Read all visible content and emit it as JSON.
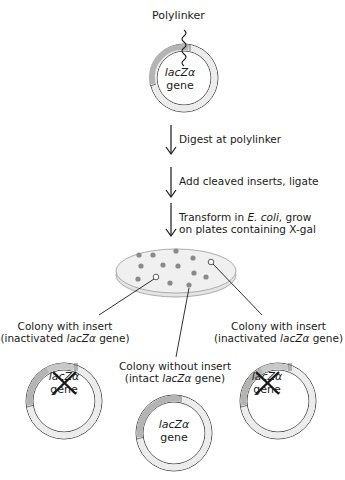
{
  "figure": {
    "top_plasmid": {
      "polylinker_label": "Polylinker",
      "gene_italic": "lacZα",
      "gene_word": "gene"
    },
    "steps": [
      {
        "line1": "Digest at polylinker"
      },
      {
        "line1": "Add cleaved inserts, ligate"
      },
      {
        "line1_prefix": "Transform in ",
        "line1_italic": "E. coli",
        "line1_suffix": ", grow",
        "line2": "on plates containing X-gal"
      }
    ],
    "plate": {
      "blue_colonies": 12,
      "white_colonies": 2
    },
    "outcomes": {
      "left": {
        "line1": "Colony with insert",
        "line2_prefix": "(inactivated ",
        "line2_italic": "lacZα",
        "line2_suffix": " gene)",
        "gene_italic": "lacZα",
        "gene_word": "gene",
        "crossed_out": true
      },
      "middle": {
        "line1": "Colony without insert",
        "line2_prefix": "(intact ",
        "line2_italic": "lacZα",
        "line2_suffix": " gene)",
        "gene_italic": "lacZα",
        "gene_word": "gene",
        "crossed_out": false
      },
      "right": {
        "line1": "Colony with insert",
        "line2_prefix": "(inactivated ",
        "line2_italic": "lacZα",
        "line2_suffix": " gene)",
        "gene_italic": "lacZα",
        "gene_word": "gene",
        "crossed_out": true
      }
    },
    "colors": {
      "ring_fill": "#ececec",
      "gene_segment": "#b4b4b4",
      "insert_segment": "#c8c8c8",
      "colony_blue": "#8a8a8a",
      "plate_fill": "#ebebeb",
      "line": "#1a1a1a"
    }
  }
}
